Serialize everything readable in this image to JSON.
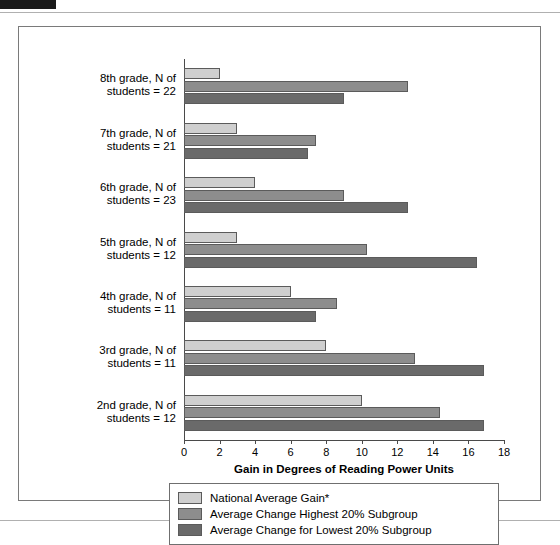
{
  "chart_data": {
    "type": "bar",
    "orientation": "horizontal",
    "title": "",
    "xlabel": "Gain in Degrees of Reading Power Units",
    "ylabel": "",
    "xlim": [
      0,
      18
    ],
    "xticks": [
      0,
      2,
      4,
      6,
      8,
      10,
      12,
      14,
      16,
      18
    ],
    "grid": false,
    "legend_position": "bottom",
    "categories": [
      "8th grade, N of students = 22",
      "7th grade, N of students = 21",
      "6th grade, N of students = 23",
      "5th grade, N of students = 12",
      "4th grade, N of students = 11",
      "3rd grade, N of students = 11",
      "2nd grade, N of students = 12"
    ],
    "category_lines": [
      [
        "8th grade, N of",
        "students = 22"
      ],
      [
        "7th grade, N of",
        "students = 21"
      ],
      [
        "6th grade, N of",
        "students = 23"
      ],
      [
        "5th grade, N of",
        "students = 12"
      ],
      [
        "4th grade, N of",
        "students = 11"
      ],
      [
        "3rd grade, N of",
        "students = 11"
      ],
      [
        "2nd grade, N of",
        "students = 12"
      ]
    ],
    "series": [
      {
        "name": "National Average Gain*",
        "color": "#cfcfcf",
        "values": [
          2.0,
          3.0,
          4.0,
          3.0,
          6.0,
          8.0,
          10.0
        ]
      },
      {
        "name": "Average Change Highest 20% Subgroup",
        "color": "#8d8d8d",
        "values": [
          12.6,
          7.4,
          9.0,
          10.3,
          8.6,
          13.0,
          14.4
        ]
      },
      {
        "name": "Average Change for Lowest 20% Subgroup",
        "color": "#6a6a6a",
        "values": [
          9.0,
          7.0,
          12.6,
          16.5,
          7.4,
          16.9,
          16.9
        ]
      }
    ]
  },
  "legend": {
    "items": [
      "National Average Gain*",
      "Average Change Highest 20% Subgroup",
      "Average Change for Lowest 20% Subgroup"
    ]
  },
  "axis": {
    "x_title": "Gain in Degrees of Reading Power Units",
    "tick_labels": [
      "0",
      "2",
      "4",
      "6",
      "8",
      "10",
      "12",
      "14",
      "16",
      "18"
    ]
  }
}
